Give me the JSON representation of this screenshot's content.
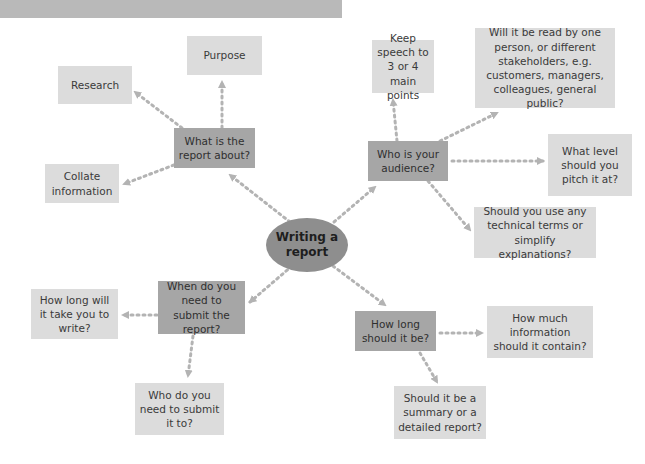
{
  "diagram": {
    "title_bar": "",
    "center": {
      "label": "Writing a report"
    },
    "branches": [
      {
        "label": "What is the report about?",
        "children": [
          "Purpose",
          "Research",
          "Collate information"
        ]
      },
      {
        "label": "Who is your audience?",
        "children": [
          "Keep speech to 3 or 4 main points",
          "Will it be read by one person, or different stakeholders, e.g. customers, managers, colleagues, general public?",
          "What level should you pitch it at?",
          "Should you use any technical terms or simplify explanations?"
        ]
      },
      {
        "label": "When do you need to submit the report?",
        "children": [
          "How long will it take you to write?",
          "Who do you need to submit it to?"
        ]
      },
      {
        "label": "How long should it be?",
        "children": [
          "How much information should it contain?",
          "Should it be a summary or a detailed report?"
        ]
      }
    ]
  },
  "colors": {
    "header_bar": "#b9b9b9",
    "leaf_box": "#dcdcdc",
    "branch_box": "#a6a6a6",
    "center_ellipse": "#8e8e8e",
    "connector": "#b3b3b3",
    "text": "#3a3a3a"
  }
}
